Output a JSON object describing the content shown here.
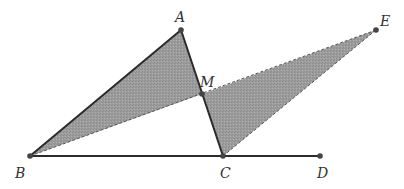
{
  "diagram": {
    "type": "geometry",
    "colors": {
      "fill": "#9a9a9a",
      "line": "#2b2b2b",
      "dashed": "#555555",
      "point": "#444444",
      "label": "#333333"
    },
    "points": [
      {
        "id": "A",
        "label": "A",
        "x": 181,
        "y": 30,
        "lx": 175,
        "ly": 22
      },
      {
        "id": "B",
        "label": "B",
        "x": 30,
        "y": 156,
        "lx": 15,
        "ly": 178
      },
      {
        "id": "C",
        "label": "C",
        "x": 223,
        "y": 156,
        "lx": 220,
        "ly": 178
      },
      {
        "id": "D",
        "label": "D",
        "x": 320,
        "y": 156,
        "lx": 317,
        "ly": 178
      },
      {
        "id": "E",
        "label": "E",
        "x": 376,
        "y": 30,
        "lx": 380,
        "ly": 26
      },
      {
        "id": "M",
        "label": "M",
        "x": 202,
        "y": 94,
        "lx": 200,
        "ly": 87
      }
    ],
    "shaded_regions": [
      {
        "name": "triangle-ABM",
        "vertices": [
          "A",
          "B",
          "M"
        ]
      },
      {
        "name": "triangle-MCE",
        "vertices": [
          "M",
          "C",
          "E"
        ]
      }
    ],
    "solid_segments": [
      [
        "A",
        "B"
      ],
      [
        "A",
        "C"
      ],
      [
        "B",
        "D"
      ]
    ],
    "dashed_segments": [
      [
        "B",
        "E"
      ],
      [
        "C",
        "E"
      ]
    ]
  }
}
